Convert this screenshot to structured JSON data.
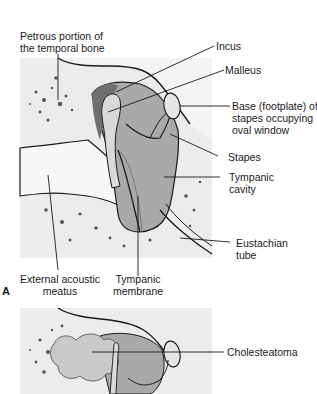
{
  "figure": {
    "panel_a": {
      "letter": "A",
      "labels": {
        "petrous": [
          "Petrous portion of",
          "the temporal bone"
        ],
        "incus": "Incus",
        "malleus": "Malleus",
        "base_footplate": [
          "Base (footplate) of",
          "stapes occupying",
          "oval window"
        ],
        "stapes": "Stapes",
        "tympanic_cavity": [
          "Tympanic",
          "cavity"
        ],
        "eustachian_tube": [
          "Eustachian",
          "tube"
        ],
        "external_meatus": [
          "External acoustic",
          "meatus"
        ],
        "tympanic_membrane": [
          "Tympanic",
          "membrane"
        ]
      }
    },
    "panel_b": {
      "labels": {
        "cholesteatoma": "Cholesteatoma"
      }
    },
    "colors": {
      "bone_bg": "#ececec",
      "cavity": "#a9a9a9",
      "dark_cavity": "#6f6f6f",
      "ossicle": "#d9d9d9",
      "line": "#1a1a1a"
    }
  }
}
